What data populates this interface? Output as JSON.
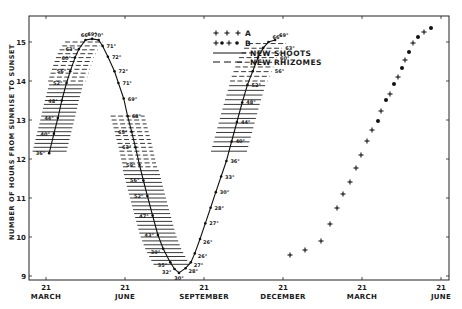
{
  "chart_data": {
    "type": "line",
    "title": "",
    "ylabel": "NUMBER OF HOURS FROM SUNRISE TO SUNSET",
    "xlabel": "",
    "ylim": [
      9,
      15.5
    ],
    "yticks": [
      9,
      10,
      11,
      12,
      13,
      14,
      15
    ],
    "xticks": [
      {
        "day": "21",
        "month": "MARCH"
      },
      {
        "day": "21",
        "month": "JUNE"
      },
      {
        "day": "21",
        "month": "SEPTEMBER"
      },
      {
        "day": "21",
        "month": "DECEMBER"
      },
      {
        "day": "21",
        "month": "MARCH"
      },
      {
        "day": "21",
        "month": "JUNE"
      }
    ],
    "grid": false,
    "legend": {
      "position": "upper-center",
      "entries": [
        {
          "symbol": "+ + +",
          "label": "A"
        },
        {
          "symbol": "+ • + •",
          "label": "B"
        },
        {
          "symbol": "solid-line",
          "label": "NEW SHOOTS"
        },
        {
          "symbol": "dashed-line",
          "label": "NEW RHIZOMES"
        }
      ]
    },
    "series": [
      {
        "name": "Day length curve (temperature annotated, °F)",
        "points": [
          {
            "x": 0.12,
            "y": 12.15,
            "label": "36°"
          },
          {
            "x": 0.3,
            "y": 12.65,
            "label": "40°"
          },
          {
            "x": 0.45,
            "y": 13.05,
            "label": "44°"
          },
          {
            "x": 0.6,
            "y": 13.5,
            "label": "48°"
          },
          {
            "x": 0.78,
            "y": 13.95,
            "label": "52°"
          },
          {
            "x": 0.92,
            "y": 14.25,
            "label": "56°"
          },
          {
            "x": 1.1,
            "y": 14.6,
            "label": "60°"
          },
          {
            "x": 1.25,
            "y": 14.82,
            "label": "63°"
          },
          {
            "x": 1.5,
            "y": 15.05,
            "label": "66°"
          },
          {
            "x": 1.75,
            "y": 15.08,
            "label": "69°"
          },
          {
            "x": 2.0,
            "y": 15.05,
            "label": "70°"
          },
          {
            "x": 2.15,
            "y": 14.9,
            "label": "71°"
          },
          {
            "x": 2.35,
            "y": 14.62,
            "label": "72°"
          },
          {
            "x": 2.6,
            "y": 14.25,
            "label": "72°"
          },
          {
            "x": 2.75,
            "y": 13.95,
            "label": "71°"
          },
          {
            "x": 2.95,
            "y": 13.55,
            "label": "69°"
          },
          {
            "x": 3.1,
            "y": 13.1,
            "label": "68°"
          },
          {
            "x": 3.25,
            "y": 12.7,
            "label": "65°"
          },
          {
            "x": 3.4,
            "y": 12.3,
            "label": "63°"
          },
          {
            "x": 3.55,
            "y": 11.85,
            "label": "59°"
          },
          {
            "x": 3.7,
            "y": 11.45,
            "label": "56°"
          },
          {
            "x": 3.85,
            "y": 11.05,
            "label": "52°"
          },
          {
            "x": 4.05,
            "y": 10.55,
            "label": "47°"
          },
          {
            "x": 4.25,
            "y": 10.05,
            "label": "43°"
          },
          {
            "x": 4.45,
            "y": 9.7,
            "label": "39°"
          },
          {
            "x": 4.72,
            "y": 9.35,
            "label": "35°"
          },
          {
            "x": 4.88,
            "y": 9.18,
            "label": "32°"
          },
          {
            "x": 5.05,
            "y": 9.08,
            "label": "30°"
          },
          {
            "x": 5.3,
            "y": 9.2,
            "label": "28°"
          },
          {
            "x": 5.5,
            "y": 9.35,
            "label": "27°"
          },
          {
            "x": 5.65,
            "y": 9.58,
            "label": "26°"
          },
          {
            "x": 5.85,
            "y": 9.95,
            "label": "26°"
          },
          {
            "x": 6.05,
            "y": 10.35,
            "label": "27°"
          },
          {
            "x": 6.25,
            "y": 10.75,
            "label": "28°"
          },
          {
            "x": 6.45,
            "y": 11.15,
            "label": "30°"
          },
          {
            "x": 6.65,
            "y": 11.55,
            "label": "33°"
          },
          {
            "x": 6.85,
            "y": 11.95,
            "label": "36°"
          },
          {
            "x": 7.05,
            "y": 12.45,
            "label": "40°"
          },
          {
            "x": 7.25,
            "y": 12.95,
            "label": "44°"
          },
          {
            "x": 7.45,
            "y": 13.45,
            "label": "48°"
          },
          {
            "x": 7.65,
            "y": 13.9,
            "label": "52°"
          },
          {
            "x": 7.85,
            "y": 14.25,
            "label": "56°"
          },
          {
            "x": 8.05,
            "y": 14.6,
            "label": "60°"
          },
          {
            "x": 8.25,
            "y": 14.85,
            "label": "63°"
          },
          {
            "x": 8.45,
            "y": 15.0,
            "label": "66°"
          },
          {
            "x": 8.7,
            "y": 15.05,
            "label": "69°"
          }
        ]
      }
    ],
    "annotations": [
      "Solid horizontal bars (new shoots) along spring rise and late-summer decline",
      "Dashed horizontal bars (new rhizomes) near summer peak and early autumn",
      "Plus marks (A) and alternating plus/dot marks (B) along second spring rise"
    ]
  }
}
